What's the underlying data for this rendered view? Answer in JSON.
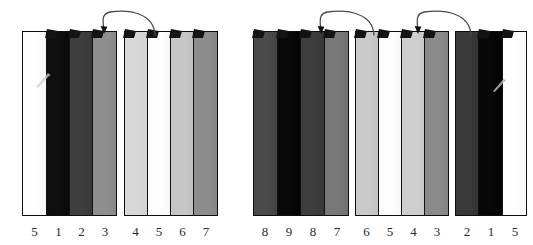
{
  "diagram": {
    "background_color": "#ffffff",
    "outline_color": "#0d0d0d",
    "label_color": "#2a2a2a",
    "arrow_color": "#4a4a4a",
    "groups": [
      {
        "id": "group-1",
        "x": 22,
        "y": 31,
        "width": 95,
        "height": 185,
        "strips": [
          {
            "label": "5",
            "color": "#fdfdfd",
            "width": 25,
            "tab": false
          },
          {
            "label": "1",
            "color": "#0f0f0f",
            "width": 23,
            "tab": true
          },
          {
            "label": "2",
            "color": "#3e3e3e",
            "width": 23,
            "tab": true
          },
          {
            "label": "3",
            "color": "#8e8e8e",
            "width": 24,
            "tab": true
          }
        ]
      },
      {
        "id": "group-2",
        "x": 124,
        "y": 31,
        "width": 94,
        "height": 185,
        "strips": [
          {
            "label": "4",
            "color": "#d8d8d8",
            "width": 23,
            "tab": true
          },
          {
            "label": "5",
            "color": "#fdfdfd",
            "width": 24,
            "tab": true
          },
          {
            "label": "6",
            "color": "#c6c6c6",
            "width": 23,
            "tab": true
          },
          {
            "label": "7",
            "color": "#8c8c8c",
            "width": 24,
            "tab": true
          }
        ]
      },
      {
        "id": "group-3",
        "x": 253,
        "y": 31,
        "width": 96,
        "height": 185,
        "strips": [
          {
            "label": "8",
            "color": "#4a4a4a",
            "width": 24,
            "tab": true
          },
          {
            "label": "9",
            "color": "#090909",
            "width": 24,
            "tab": true
          },
          {
            "label": "8",
            "color": "#3d3d3d",
            "width": 24,
            "tab": true
          },
          {
            "label": "7",
            "color": "#787878",
            "width": 24,
            "tab": true
          }
        ]
      },
      {
        "id": "group-4",
        "x": 355,
        "y": 31,
        "width": 94,
        "height": 185,
        "strips": [
          {
            "label": "6",
            "color": "#c9c9c9",
            "width": 23,
            "tab": true
          },
          {
            "label": "5",
            "color": "#fdfdfd",
            "width": 24,
            "tab": true
          },
          {
            "label": "4",
            "color": "#cfcfcf",
            "width": 23,
            "tab": true
          },
          {
            "label": "3",
            "color": "#8a8a8a",
            "width": 24,
            "tab": true
          }
        ]
      },
      {
        "id": "group-5",
        "x": 455,
        "y": 31,
        "width": 72,
        "height": 185,
        "strips": [
          {
            "label": "2",
            "color": "#3a3a3a",
            "width": 24,
            "tab": false
          },
          {
            "label": "1",
            "color": "#080808",
            "width": 24,
            "tab": true
          },
          {
            "label": "5",
            "color": "#fdfdfd",
            "width": 24,
            "tab": true
          }
        ]
      }
    ],
    "arrows": [
      {
        "id": "arrow-1",
        "from_group": "group-2",
        "to_group": "group-1",
        "x": 98,
        "y": 8,
        "width": 60,
        "height": 28,
        "direction": "right-to-left"
      },
      {
        "id": "arrow-2",
        "from_group": "group-3",
        "to_group": "group-2",
        "x": 315,
        "y": 8,
        "width": 62,
        "height": 28,
        "direction": "right-to-left"
      },
      {
        "id": "arrow-3",
        "from_group": "group-5",
        "to_group": "group-4",
        "x": 412,
        "y": 8,
        "width": 62,
        "height": 28,
        "direction": "right-to-left"
      }
    ],
    "glints": [
      {
        "id": "glint-1",
        "x": 35,
        "y": 72,
        "width": 18,
        "height": 16
      },
      {
        "id": "glint-2",
        "x": 491,
        "y": 78,
        "width": 18,
        "height": 14
      }
    ]
  }
}
